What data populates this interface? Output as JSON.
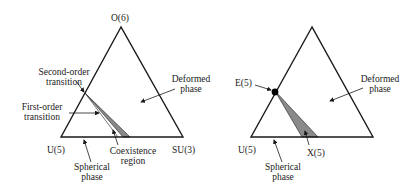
{
  "left_diagram": {
    "vertices": {
      "top": "O(6)",
      "bottom_left": "U(5)",
      "bottom_right": "SU(3)"
    },
    "labels": {
      "second_order_1": "Second-order",
      "second_order_2": "transition",
      "first_order_1": "First-order",
      "first_order_2": "transition",
      "deformed_1": "Deformed",
      "deformed_2": "phase",
      "spherical_1": "Spherical",
      "spherical_2": "phase",
      "coexistence_1": "Coexistence",
      "coexistence_2": "region"
    }
  },
  "right_diagram": {
    "vertices": {
      "bottom_left": "U(5)"
    },
    "labels": {
      "critical_point": "E(5)",
      "critical_point_2": "X(5)",
      "deformed_1": "Deformed",
      "deformed_2": "phase",
      "spherical_1": "Spherical",
      "spherical_2": "phase"
    }
  },
  "colors": {
    "line": "#1a1a1a",
    "region_fill": "#8a8a8a"
  }
}
